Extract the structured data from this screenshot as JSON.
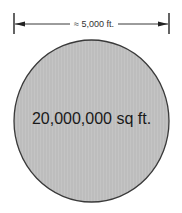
{
  "diagram": {
    "dimension": {
      "label": "≈ 5,000 ft.",
      "line_color": "#222222"
    },
    "circle": {
      "area_label": "20,000,000 sq ft.",
      "fill_color": "#bdbdbd",
      "stroke_color": "#3a3a3a"
    }
  }
}
